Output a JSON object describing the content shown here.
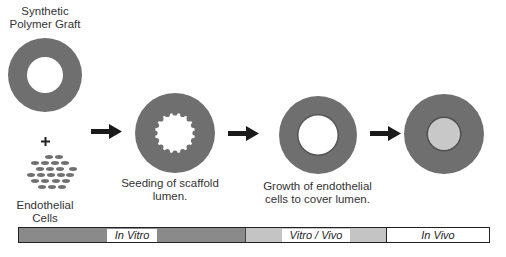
{
  "title": {
    "line1": "Synthetic",
    "line2": "Polymer Graft"
  },
  "plus": "+",
  "cells_label": {
    "line1": "Endothelial",
    "line2": "Cells"
  },
  "stage2_label": {
    "line1": "Seeding of scaffold",
    "line2": "lumen."
  },
  "stage3_label": {
    "line1": "Growth of endothelial",
    "line2": "cells to cover lumen."
  },
  "timeline": {
    "segments": [
      {
        "label": "In Vitro",
        "color": "#8a8a8a"
      },
      {
        "label": "Vitro /  Vivo",
        "color": "#c4c4c4"
      },
      {
        "label": "In Vivo",
        "color": "#ffffff"
      }
    ]
  },
  "colors": {
    "graft_ring": "#6f6f6f",
    "lumen_open": "#ffffff",
    "lumen_filled": "#c8c8c8",
    "arrow": "#1a1a1a",
    "cell": "#707070"
  }
}
